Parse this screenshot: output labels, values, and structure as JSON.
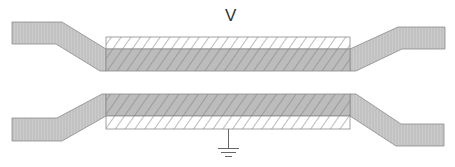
{
  "diagram": {
    "voltage_label": "V",
    "ground_label": "",
    "colors": {
      "lead_fill": "#c8c8c8",
      "lead_stripe": "#b0b0b0",
      "plate_fill": "#bdbdbd",
      "dielectric_fill": "#ffffff",
      "hatch": "#777777",
      "outline": "#8a8a8a",
      "ground": "#666666"
    },
    "components": [
      {
        "id": "top-electrode",
        "type": "electrode",
        "terminal": "V"
      },
      {
        "id": "top-dielectric",
        "type": "dielectric-layer"
      },
      {
        "id": "bottom-electrode",
        "type": "electrode",
        "terminal": "ground"
      },
      {
        "id": "bottom-dielectric",
        "type": "dielectric-layer"
      }
    ]
  }
}
